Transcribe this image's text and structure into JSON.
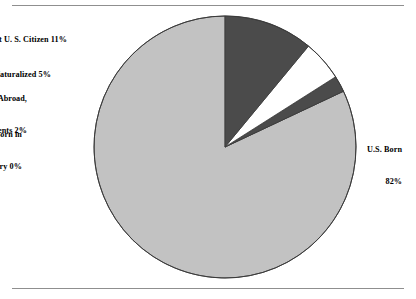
{
  "chart_data": {
    "type": "pie",
    "title": "",
    "subtitle": "",
    "xlabel": "",
    "ylabel": "",
    "legend_position": "none",
    "grid": false,
    "labels_position": "outside",
    "start_angle_deg": 90,
    "direction": "counterclockwise",
    "categories": [
      "U.S. Born",
      "Born in U. S. Territory",
      "Born Abroad, American Parents",
      "Naturalized",
      "Not U. S. Citizen"
    ],
    "values": [
      82,
      0,
      2,
      5,
      11
    ],
    "units": "percent",
    "slices": [
      {
        "name": "U.S. Born",
        "value": 82,
        "value_label": "82%",
        "label_lines": [
          "U.S. Born",
          "82%"
        ],
        "color": "#c2c2c2"
      },
      {
        "name": "Born in U. S. Territory",
        "value": 0,
        "value_label": "0%",
        "label_lines": [
          "Born in",
          "U. S.Territory 0%"
        ],
        "color": "#ffffff"
      },
      {
        "name": "Born Abroad, American Parents",
        "value": 2,
        "value_label": "2%",
        "label_lines": [
          "Born Abroad,",
          "American Parents 2%"
        ],
        "color": "#4b4b4b"
      },
      {
        "name": "Naturalized",
        "value": 5,
        "value_label": "5%",
        "label_lines": [
          "Naturalized 5%"
        ],
        "color": "#ffffff"
      },
      {
        "name": "Not U. S. Citizen",
        "value": 11,
        "value_label": "11%",
        "label_lines": [
          "Not U. S. Citizen 11%"
        ],
        "color": "#4b4b4b"
      }
    ]
  },
  "labels": {
    "not_citizen": "Not U. S. Citizen 11%",
    "naturalized": "Naturalized 5%",
    "born_abroad_line1": "Born Abroad,",
    "born_abroad_line2": "American Parents 2%",
    "territory_line1": "Born in",
    "territory_line2": "U. S.Territory 0%",
    "us_born_line1": "U.S. Born",
    "us_born_line2": "82%"
  },
  "style": {
    "background": "#ffffff",
    "rule_color": "#8f8f8f",
    "outline_color": "#3a3a3a",
    "light_gray": "#c2c2c2",
    "dark_gray": "#4b4b4b",
    "white_slice": "#ffffff",
    "text_color": "#000000"
  },
  "geometry": {
    "center_x": 225,
    "center_y": 147,
    "radius": 131
  }
}
